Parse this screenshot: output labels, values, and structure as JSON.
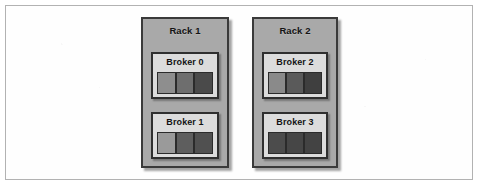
{
  "figure": {
    "type": "diagram",
    "background_color": "#ffffff",
    "frame_border_color": "#b2b2b2",
    "rack_fill_color": "#a9a9a9",
    "broker_fill_color": "#dcdcdc",
    "outline_color": "#2f2f2f"
  },
  "racks": [
    {
      "label": "Rack 1",
      "brokers": [
        {
          "label": "Broker 0",
          "partitions": [
            {
              "name": "partition-replica-0",
              "color": "#8e8e8e"
            },
            {
              "name": "partition-replica-1",
              "color": "#6e6e6e"
            },
            {
              "name": "partition-replica-2",
              "color": "#4a4a4a"
            }
          ]
        },
        {
          "label": "Broker 1",
          "partitions": [
            {
              "name": "partition-replica-0",
              "color": "#9a9a9a"
            },
            {
              "name": "partition-replica-1",
              "color": "#5e5e5e"
            },
            {
              "name": "partition-replica-2",
              "color": "#505050"
            }
          ]
        }
      ]
    },
    {
      "label": "Rack 2",
      "brokers": [
        {
          "label": "Broker 2",
          "partitions": [
            {
              "name": "partition-replica-0",
              "color": "#8a8a8a"
            },
            {
              "name": "partition-replica-1",
              "color": "#5a5a5a"
            },
            {
              "name": "partition-replica-2",
              "color": "#3f3f3f"
            }
          ]
        },
        {
          "label": "Broker 3",
          "partitions": [
            {
              "name": "partition-replica-0",
              "color": "#4c4c4c"
            },
            {
              "name": "partition-replica-1",
              "color": "#464646"
            },
            {
              "name": "partition-replica-2",
              "color": "#434343"
            }
          ]
        }
      ]
    }
  ]
}
